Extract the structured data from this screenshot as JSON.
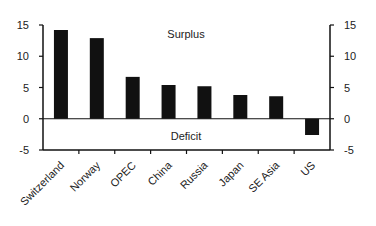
{
  "chart_data": {
    "type": "bar",
    "title": "",
    "xlabel": "",
    "ylabel": "",
    "categories": [
      "Switzerland",
      "Norway",
      "OPEC",
      "China",
      "Russia",
      "Japan",
      "SE Asia",
      "US"
    ],
    "values": [
      14.2,
      12.9,
      6.7,
      5.4,
      5.2,
      3.8,
      3.6,
      -2.6
    ],
    "ylim": [
      -5,
      15
    ],
    "yticks": [
      -5,
      0,
      5,
      10,
      15
    ],
    "secondary_yticks": [
      -5,
      0,
      5,
      10,
      15
    ],
    "annotations": [
      {
        "text": "Surplus",
        "position": "above zero line"
      },
      {
        "text": "Deficit",
        "position": "below zero line"
      }
    ],
    "grid": false,
    "legend": null,
    "bar_color": "#111111"
  }
}
